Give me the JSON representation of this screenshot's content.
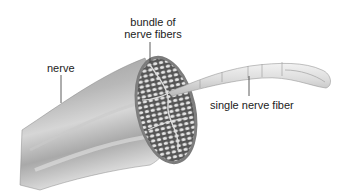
{
  "diagram": {
    "labels": {
      "bundle": "bundle of\nnerve fibers",
      "bundle_line1": "bundle of",
      "bundle_line2": "nerve fibers",
      "nerve": "nerve",
      "fiber": "single nerve fiber"
    },
    "colors": {
      "nerve_dark": "#8a8a8a",
      "nerve_light": "#d8d8d8",
      "fiber": "#e4e4e4",
      "label_text": "#222222",
      "leader_line": "#333333"
    }
  }
}
